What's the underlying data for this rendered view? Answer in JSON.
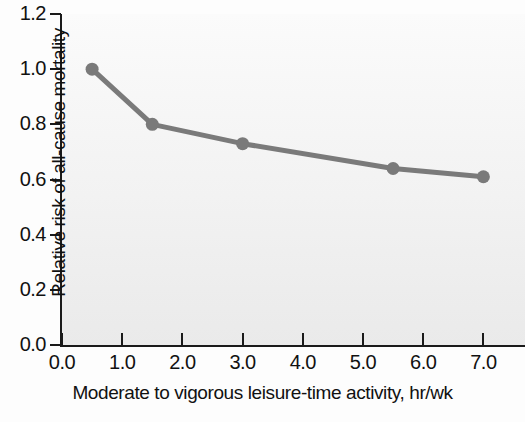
{
  "chart_data": {
    "type": "line",
    "title": "",
    "xlabel": "Moderate to vigorous leisure-time activity, hr/wk",
    "ylabel": "Relative risk of all-cause mortality",
    "xlim": [
      0.0,
      7.75
    ],
    "ylim": [
      0.0,
      1.2
    ],
    "grid": false,
    "legend": null,
    "xticks": [
      "0.0",
      "1.0",
      "2.0",
      "3.0",
      "4.0",
      "5.0",
      "6.0",
      "7.0"
    ],
    "xtick_values": [
      0.0,
      1.0,
      2.0,
      3.0,
      4.0,
      5.0,
      6.0,
      7.0
    ],
    "yticks": [
      "0.0",
      "0.2",
      "0.4",
      "0.6",
      "0.8",
      "1.0",
      "1.2"
    ],
    "ytick_values": [
      0.0,
      0.2,
      0.4,
      0.6,
      0.8,
      1.0,
      1.2
    ],
    "x": [
      0.5,
      1.5,
      3.0,
      5.5,
      7.0
    ],
    "values": [
      1.0,
      0.8,
      0.73,
      0.64,
      0.61
    ],
    "series": [
      {
        "name": "Relative risk of all-cause mortality",
        "x": [
          0.5,
          1.5,
          3.0,
          5.5,
          7.0
        ],
        "values": [
          1.0,
          0.8,
          0.73,
          0.64,
          0.61
        ],
        "color": "#7a7a7a",
        "marker": "circle",
        "line_width": 5
      }
    ]
  },
  "style": {
    "line_color": "#7a7a7a",
    "marker_color": "#7a7a7a",
    "axis_color": "#1a1a1a",
    "plot_background": "#f2f2f2",
    "figure_background": "#fdfdfd",
    "text_color": "#111111"
  }
}
